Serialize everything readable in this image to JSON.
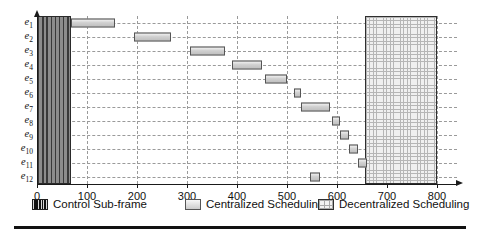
{
  "chart_data": {
    "type": "bar",
    "orientation": "horizontal",
    "title": "",
    "xlabel": "",
    "ylabel": "",
    "xlim": [
      0,
      840
    ],
    "ylim_categories": 12,
    "grid": true,
    "legend_position": "bottom",
    "categories": [
      "e1",
      "e2",
      "e3",
      "e4",
      "e5",
      "e6",
      "e7",
      "e8",
      "e9",
      "e10",
      "e11",
      "e12"
    ],
    "category_labels": [
      {
        "base": "e",
        "sub": "1"
      },
      {
        "base": "e",
        "sub": "2"
      },
      {
        "base": "e",
        "sub": "3"
      },
      {
        "base": "e",
        "sub": "4"
      },
      {
        "base": "e",
        "sub": "5"
      },
      {
        "base": "e",
        "sub": "6"
      },
      {
        "base": "e",
        "sub": "7"
      },
      {
        "base": "e",
        "sub": "8"
      },
      {
        "base": "e",
        "sub": "9"
      },
      {
        "base": "e",
        "sub": "10"
      },
      {
        "base": "e",
        "sub": "11"
      },
      {
        "base": "e",
        "sub": "12"
      }
    ],
    "xticks": [
      0,
      100,
      200,
      300,
      400,
      500,
      600,
      700,
      800
    ],
    "xtick_labels": [
      "0",
      "100",
      "200",
      "300",
      "400",
      "500",
      "600",
      "700",
      "800"
    ],
    "series": [
      {
        "name": "Control Sub-frame",
        "type": "span-block",
        "start": 0,
        "end": 68,
        "spans_all_rows": true,
        "color": "#7d7d7d",
        "pattern": "vertical-stripes"
      },
      {
        "name": "Centralized Scheduling",
        "type": "gantt",
        "color": "#cbcbcb",
        "pattern": "solid",
        "bars": [
          {
            "category": "e1",
            "start": 68,
            "end": 155,
            "duration": 87
          },
          {
            "category": "e2",
            "start": 193,
            "end": 268,
            "duration": 75
          },
          {
            "category": "e3",
            "start": 305,
            "end": 375,
            "duration": 70
          },
          {
            "category": "e4",
            "start": 390,
            "end": 450,
            "duration": 60
          },
          {
            "category": "e5",
            "start": 455,
            "end": 500,
            "duration": 45
          },
          {
            "category": "e6",
            "start": 513,
            "end": 528,
            "duration": 15
          },
          {
            "category": "e7",
            "start": 528,
            "end": 585,
            "duration": 57
          },
          {
            "category": "e8",
            "start": 590,
            "end": 605,
            "duration": 15
          },
          {
            "category": "e9",
            "start": 606,
            "end": 624,
            "duration": 18
          },
          {
            "category": "e10",
            "start": 624,
            "end": 641,
            "duration": 17
          },
          {
            "category": "e11",
            "start": 641,
            "end": 660,
            "duration": 19
          },
          {
            "category": "e12",
            "start": 545,
            "end": 565,
            "duration": 20
          }
        ]
      },
      {
        "name": "Decentralized Scheduling",
        "type": "span-block",
        "start": 655,
        "end": 800,
        "spans_all_rows": true,
        "color": "#f0f0f0",
        "pattern": "cross-hatch"
      }
    ]
  },
  "legend": {
    "items": [
      {
        "label": "Control Sub-frame",
        "swatch": "control-subframe-swatch"
      },
      {
        "label": "Centralized Scheduling",
        "swatch": "centralized-scheduling-swatch"
      },
      {
        "label": "Decentralized Scheduling",
        "swatch": "decentralized-scheduling-swatch"
      }
    ]
  }
}
